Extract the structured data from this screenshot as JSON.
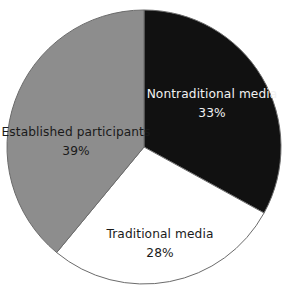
{
  "chart_data": {
    "type": "pie",
    "title": "",
    "subtitle": "",
    "xlabel": "",
    "ylabel": "",
    "legend_position": "none",
    "grid": false,
    "labels_inside": true,
    "start_angle_deg": 0,
    "direction": "clockwise",
    "categories": [
      "Nontraditional media",
      "Traditional media",
      "Established participants"
    ],
    "values": [
      33,
      28,
      39
    ],
    "value_suffix": "%",
    "slices": [
      {
        "name": "Nontraditional media",
        "label": "Nontraditional media",
        "value": 33,
        "value_text": "33%",
        "color": "#111111",
        "text_color": "#f2f2f2",
        "start_deg": 0,
        "end_deg": 118.8,
        "label_x": 212,
        "label_y": 98,
        "value_x": 212,
        "value_y": 117
      },
      {
        "name": "Traditional media",
        "label": "Traditional media",
        "value": 28,
        "value_text": "28%",
        "color": "#ffffff",
        "text_color": "#1a1a1a",
        "start_deg": 118.8,
        "end_deg": 219.6,
        "label_x": 160,
        "label_y": 238,
        "value_x": 160,
        "value_y": 257
      },
      {
        "name": "Established participants",
        "label": "Established participants",
        "value": 39,
        "value_text": "39%",
        "color": "#8d8d8d",
        "text_color": "#1a1a1a",
        "start_deg": 219.6,
        "end_deg": 360,
        "label_x": 76,
        "label_y": 136,
        "value_x": 76,
        "value_y": 155
      }
    ],
    "geometry": {
      "center_x": 144,
      "center_y": 147,
      "radius": 137
    },
    "stroke_color": "#6b6b6b",
    "background": "#ffffff"
  }
}
